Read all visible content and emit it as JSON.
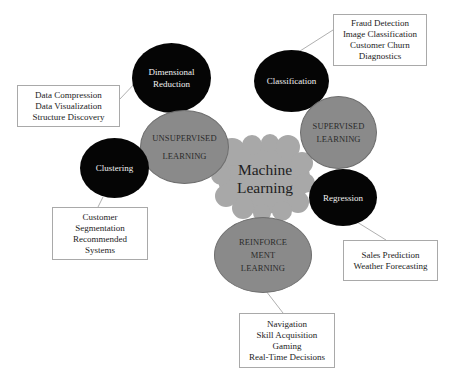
{
  "center": {
    "label_line1": "Machine",
    "label_line2": "Learning"
  },
  "categories": {
    "unsupervised": {
      "line1": "UNSUPERVISED",
      "line2": "LEARNING"
    },
    "supervised": {
      "line1": "SUPERVISED",
      "line2": "LEARNING"
    },
    "reinforcement": {
      "line1": "REINFORCE",
      "line2": "MENT",
      "line3": "LEARNING"
    }
  },
  "techniques": {
    "dimensional_reduction": {
      "line1": "Dimensional",
      "line2": "Reduction"
    },
    "clustering": {
      "label": "Clustering"
    },
    "classification": {
      "label": "Classification"
    },
    "regression": {
      "label": "Regression"
    }
  },
  "applications": {
    "dimensional_reduction": [
      "Data Compression",
      "Data Visualization",
      "Structure Discovery"
    ],
    "classification": [
      "Fraud Detection",
      "Image Classification",
      "Customer Churn",
      "Diagnostics"
    ],
    "clustering": [
      "Customer",
      "Segmentation",
      "Recommended",
      "Systems"
    ],
    "regression": [
      "Sales Prediction",
      "Weather Forecasting"
    ],
    "reinforcement": [
      "Navigation",
      "Skill Acquisition",
      "Gaming",
      "Real-Time Decisions"
    ]
  },
  "colors": {
    "technique_fill": "#050505",
    "category_fill": "#8a8a8a",
    "cloud_fill": "#a8a8a8",
    "connector": "#b0b0b0",
    "box_border": "#a9a9a9"
  }
}
